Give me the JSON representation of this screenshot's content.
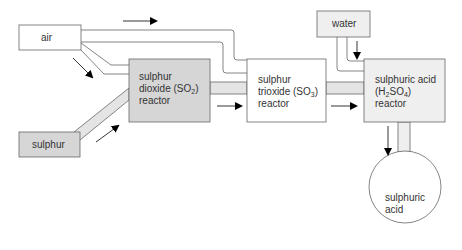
{
  "diagram": {
    "nodes": {
      "air": {
        "label": "air"
      },
      "sulphur": {
        "label": "sulphur"
      },
      "water": {
        "label": "water"
      },
      "so2_reactor": {
        "line1": "sulphur",
        "line2a": "dioxide (SO",
        "line2sub": "2",
        "line2b": ")",
        "line3": "reactor"
      },
      "so3_reactor": {
        "line1": "sulphur",
        "line2a": "trioxide (SO",
        "line2sub": "3",
        "line2b": ")",
        "line3": "reactor"
      },
      "h2so4_reactor": {
        "line1": "sulphuric acid",
        "line2a": "(H",
        "line2sub1": "2",
        "line2b": "SO",
        "line2sub2": "4",
        "line2c": ")",
        "line3": "reactor"
      },
      "product": {
        "line1": "sulphuric",
        "line2": "acid"
      }
    },
    "flows": [
      {
        "from": "air",
        "to": "so2_reactor"
      },
      {
        "from": "air",
        "to": "so3_reactor"
      },
      {
        "from": "sulphur",
        "to": "so2_reactor"
      },
      {
        "from": "so2_reactor",
        "to": "so3_reactor"
      },
      {
        "from": "so3_reactor",
        "to": "h2so4_reactor"
      },
      {
        "from": "water",
        "to": "h2so4_reactor"
      },
      {
        "from": "h2so4_reactor",
        "to": "product"
      }
    ],
    "colors": {
      "dark_fill": "#d6d6d6",
      "light_fill": "#efefef",
      "pipe_fill": "#e4e4e4",
      "stroke": "#666666",
      "arrow": "#000000"
    }
  }
}
